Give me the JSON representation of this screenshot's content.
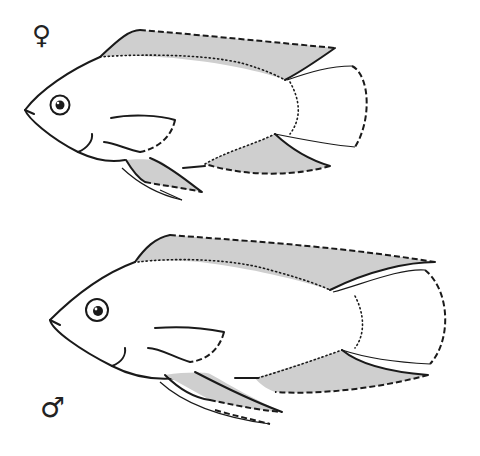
{
  "figure": {
    "type": "sexual dimorphism illustration",
    "subjects": [
      {
        "id": "female",
        "symbol": "♀",
        "label": "female fish"
      },
      {
        "id": "male",
        "symbol": "♂",
        "label": "male fish"
      }
    ],
    "colors": {
      "outline": "#1a1a1a",
      "fin_shading": "#cfcfcf",
      "background": "#ffffff"
    }
  }
}
